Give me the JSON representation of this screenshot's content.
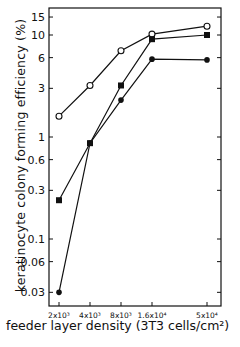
{
  "chart_data": {
    "type": "line",
    "title": "",
    "xlabel": "feeder layer density (3T3 cells/cm²)",
    "ylabel": "keratinocyte colony forming efficiency (%)",
    "xscale": "log",
    "yscale": "log",
    "x": [
      2000,
      4000,
      8000,
      16000,
      50000
    ],
    "x_tick_labels": [
      "2x10³",
      "4x10³",
      "8x10³",
      "1.6x10⁴",
      "5x10⁴"
    ],
    "y_ticks": [
      0.03,
      0.06,
      0.1,
      0.3,
      0.6,
      1,
      3,
      6,
      10,
      15
    ],
    "y_tick_labels": [
      "0.03",
      "0.06",
      "0.1",
      "0.3",
      "0.6",
      "1",
      "3",
      "6",
      "10",
      "15"
    ],
    "ylim": [
      0.025,
      20
    ],
    "grid": false,
    "legend": null,
    "series": [
      {
        "name": "open circles",
        "marker": "open-circle",
        "values": [
          1.6,
          3.2,
          7.0,
          10.2,
          12.2
        ]
      },
      {
        "name": "filled squares",
        "marker": "filled-square",
        "values": [
          0.24,
          0.87,
          3.2,
          9.1,
          10.0
        ]
      },
      {
        "name": "filled circles",
        "marker": "filled-circle",
        "values": [
          0.03,
          0.87,
          2.3,
          5.8,
          5.7
        ]
      }
    ]
  },
  "labels": {
    "ylabel": "keratinocyte colony forming efficiency  (%)",
    "xlabel": "feeder layer density  (3T3 cells/cm²)"
  }
}
